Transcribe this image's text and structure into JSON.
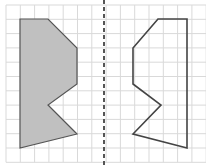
{
  "diagram": {
    "grid": {
      "x0": 6,
      "y0": 5,
      "cell": 14.3,
      "cols": 14,
      "rows": 11,
      "color": "#d9d9d9"
    },
    "mirror_line": {
      "x": 104,
      "color": "#555555"
    },
    "left_shape": {
      "fill": "#c0c0c0",
      "stroke": "#555555",
      "points": "20,19 48,19 77,48 77,84 48,105 77,134 20,148"
    },
    "right_shape": {
      "fill": "none",
      "stroke": "#444444",
      "points": "158,19 187,19 187,148 133,134 161,105 133,84 133,48"
    }
  }
}
